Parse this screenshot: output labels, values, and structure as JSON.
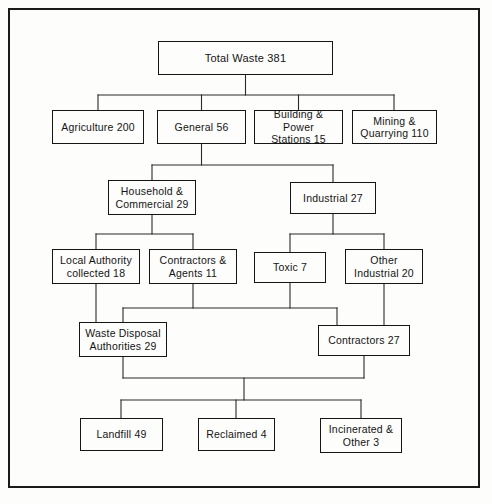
{
  "diagram": {
    "type": "flowchart",
    "units_note": "",
    "frame_color": "#1a1a1a",
    "box_border_color": "#151515",
    "line_color": "#2a2a2a",
    "background_color": "#fdfdfb",
    "nodes": [
      {
        "id": "total_waste",
        "label": "Total Waste  381",
        "value": 381,
        "x": 158,
        "y": 41,
        "w": 175,
        "h": 34
      },
      {
        "id": "agriculture",
        "label": "Agriculture  200",
        "value": 200,
        "x": 52,
        "y": 110,
        "w": 92,
        "h": 34
      },
      {
        "id": "general",
        "label": "General  56",
        "value": 56,
        "x": 157,
        "y": 110,
        "w": 89,
        "h": 34
      },
      {
        "id": "building_power",
        "label": "Building & Power\nStations 15",
        "value": 15,
        "x": 254,
        "y": 110,
        "w": 89,
        "h": 34
      },
      {
        "id": "mining_quarrying",
        "label": "Mining &\nQuarrying 110",
        "value": 110,
        "x": 352,
        "y": 110,
        "w": 85,
        "h": 34
      },
      {
        "id": "household_comm",
        "label": "Household &\nCommercial 29",
        "value": 29,
        "x": 108,
        "y": 180,
        "w": 88,
        "h": 35
      },
      {
        "id": "industrial",
        "label": "Industrial  27",
        "value": 27,
        "x": 290,
        "y": 182,
        "w": 86,
        "h": 32
      },
      {
        "id": "local_authority",
        "label": "Local Authority\ncollected  18",
        "value": 18,
        "x": 52,
        "y": 249,
        "w": 88,
        "h": 35
      },
      {
        "id": "contractors_agents",
        "label": "Contractors &\nAgents 11",
        "value": 11,
        "x": 149,
        "y": 249,
        "w": 88,
        "h": 35
      },
      {
        "id": "toxic",
        "label": "Toxic 7",
        "value": 7,
        "x": 254,
        "y": 252,
        "w": 72,
        "h": 31
      },
      {
        "id": "other_industrial",
        "label": "Other\nIndustrial 20",
        "value": 20,
        "x": 345,
        "y": 249,
        "w": 78,
        "h": 35
      },
      {
        "id": "waste_disposal",
        "label": "Waste Disposal\nAuthorities  29",
        "value": 29,
        "x": 79,
        "y": 322,
        "w": 88,
        "h": 35
      },
      {
        "id": "contractors_27",
        "label": "Contractors 27",
        "value": 27,
        "x": 318,
        "y": 325,
        "w": 92,
        "h": 31
      },
      {
        "id": "landfill",
        "label": "Landfill 49",
        "value": 49,
        "x": 80,
        "y": 418,
        "w": 83,
        "h": 33
      },
      {
        "id": "reclaimed",
        "label": "Reclaimed 4",
        "value": 4,
        "x": 198,
        "y": 418,
        "w": 77,
        "h": 33
      },
      {
        "id": "incinerated_other",
        "label": "Incinerated &\nOther 3",
        "value": 3,
        "x": 320,
        "y": 418,
        "w": 82,
        "h": 35
      }
    ],
    "edges": [
      {
        "from": "total_waste",
        "to": "agriculture"
      },
      {
        "from": "total_waste",
        "to": "general"
      },
      {
        "from": "total_waste",
        "to": "building_power"
      },
      {
        "from": "total_waste",
        "to": "mining_quarrying"
      },
      {
        "from": "general",
        "to": "household_comm"
      },
      {
        "from": "general",
        "to": "industrial"
      },
      {
        "from": "household_comm",
        "to": "local_authority"
      },
      {
        "from": "household_comm",
        "to": "contractors_agents"
      },
      {
        "from": "industrial",
        "to": "toxic"
      },
      {
        "from": "industrial",
        "to": "other_industrial"
      },
      {
        "from": "local_authority",
        "to": "waste_disposal"
      },
      {
        "from": "contractors_agents",
        "to": "contractors_27"
      },
      {
        "from": "toxic",
        "to": "contractors_27"
      },
      {
        "from": "other_industrial",
        "to": "contractors_27"
      },
      {
        "from": "waste_disposal",
        "to": "landfill"
      },
      {
        "from": "waste_disposal",
        "to": "reclaimed"
      },
      {
        "from": "waste_disposal",
        "to": "incinerated_other"
      },
      {
        "from": "contractors_27",
        "to": "landfill"
      },
      {
        "from": "contractors_27",
        "to": "reclaimed"
      },
      {
        "from": "contractors_27",
        "to": "incinerated_other"
      }
    ],
    "connector_paths": [
      "M 245.5 75 L 245.5 95",
      "M 98 95 L 394 95",
      "M 98 95 L 98 110",
      "M 201.5 95 L 201.5 110",
      "M 298.5 95 L 298.5 110",
      "M 394 95 L 394 110",
      "M 201.5 144 L 201.5 165",
      "M 152 165 L 333 165",
      "M 152 165 L 152 180",
      "M 333 165 L 333 182",
      "M 152 215 L 152 234",
      "M 96 234 L 193 234",
      "M 96 234 L 96 249",
      "M 193 234 L 193 249",
      "M 333 214 L 333 234",
      "M 290 234 L 384 234",
      "M 290 234 L 290 252",
      "M 384 234 L 384 249",
      "M 96 284 L 96 322",
      "M 193 283 L 193 308",
      "M 290 283 L 290 308",
      "M 123 308 L 337 308",
      "M 123 308 L 123 322",
      "M 337 308 L 337 325",
      "M 384 284 L 384 325",
      "M 123 357 L 123 378",
      "M 123 378 L 364 378",
      "M 364 356 L 364 378",
      "M 244 378 L 244 400",
      "M 121 400 L 361 400",
      "M 121 400 L 121 418",
      "M 236 400 L 236 418",
      "M 361 400 L 361 418"
    ]
  }
}
